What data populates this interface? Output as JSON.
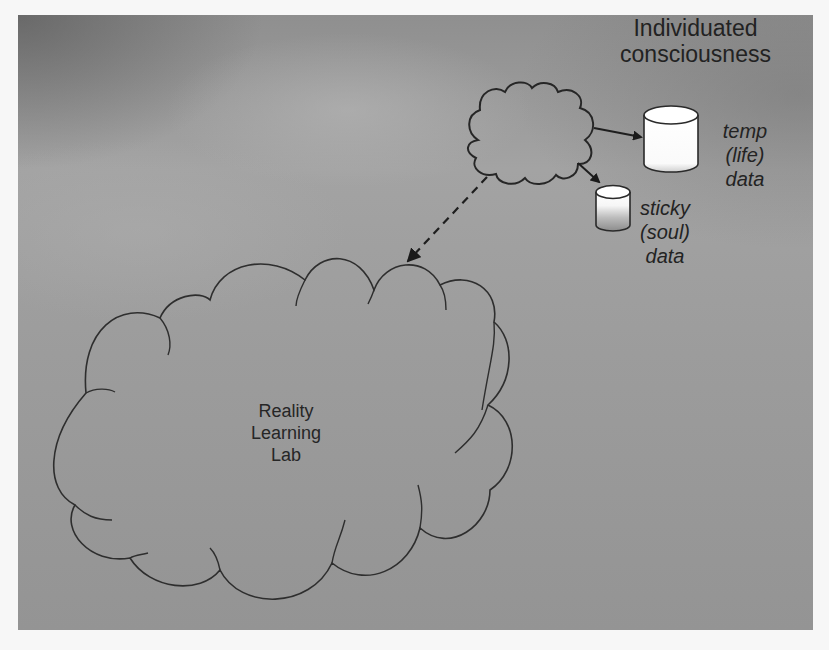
{
  "diagram": {
    "title": {
      "line1": "Individuated",
      "line2": "consciousness"
    },
    "small_cloud": {
      "name": "individuated-consciousness-cloud"
    },
    "large_cloud": {
      "label": {
        "line1": "Reality",
        "line2": "Learning",
        "line3": "Lab"
      }
    },
    "temp_store": {
      "line1": "temp",
      "line2": "(life)",
      "line3": "data"
    },
    "sticky_store": {
      "line1": "sticky",
      "line2": "(soul)",
      "line3": "data"
    },
    "connectors": [
      {
        "from": "individuated-consciousness-cloud",
        "to": "temp-life-data",
        "style": "solid"
      },
      {
        "from": "individuated-consciousness-cloud",
        "to": "sticky-soul-data",
        "style": "solid"
      },
      {
        "from": "individuated-consciousness-cloud",
        "to": "reality-learning-lab",
        "style": "dashed"
      }
    ],
    "colors": {
      "background": "#9a9a9a",
      "stroke": "#2a2a2a",
      "cylinder_fill": "#ffffff"
    }
  }
}
